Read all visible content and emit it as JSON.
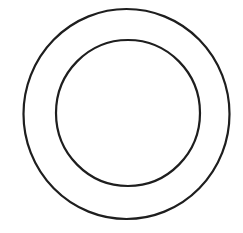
{
  "canvas": {
    "width": 243,
    "height": 233,
    "background": "#ffffff"
  },
  "stroke": {
    "color": "#1e1e1e",
    "width": 2.2
  },
  "shapes": [
    {
      "name": "outer-circle",
      "type": "ellipse",
      "cx": 126.5,
      "cy": 114,
      "rx": 103,
      "ry": 105
    },
    {
      "name": "inner-circle",
      "type": "ellipse",
      "cx": 128,
      "cy": 113,
      "rx": 72,
      "ry": 73
    }
  ]
}
